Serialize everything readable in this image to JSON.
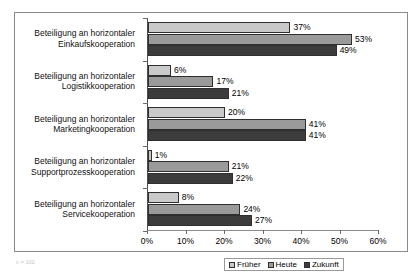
{
  "chart_data": {
    "type": "bar",
    "orientation": "horizontal",
    "title": "",
    "xlabel": "",
    "ylabel": "",
    "xlim": [
      0,
      60
    ],
    "xticks": [
      0,
      10,
      20,
      30,
      40,
      50,
      60
    ],
    "xtick_labels": [
      "0%",
      "10%",
      "20%",
      "30%",
      "40%",
      "50%",
      "60%"
    ],
    "grid": false,
    "legend_position": "bottom",
    "value_suffix": "%",
    "categories": [
      "Beteiligung an horizontaler Einkaufskooperation",
      "Beteiligung an horizontaler Logistikkooperation",
      "Beteiligung an horizontaler Marketingkooperation",
      "Beteiligung an horizontaler Supportprozesskooperation",
      "Beteiligung an horizontaler Servicekooperation"
    ],
    "category_lines": [
      [
        "Beteiligung an horizontaler",
        "Einkaufskooperation"
      ],
      [
        "Beteiligung an horizontaler",
        "Logistikkooperation"
      ],
      [
        "Beteiligung an horizontaler",
        "Marketingkooperation"
      ],
      [
        "Beteiligung an horizontaler",
        "Supportprozesskooperation"
      ],
      [
        "Beteiligung an horizontaler",
        "Servicekooperation"
      ]
    ],
    "series": [
      {
        "name": "Früher",
        "color": "#c9c9c9",
        "values": [
          37,
          6,
          20,
          1,
          8
        ]
      },
      {
        "name": "Heute",
        "color": "#9a9a9a",
        "values": [
          53,
          17,
          41,
          21,
          24
        ]
      },
      {
        "name": "Zukunft",
        "color": "#3c3c3c",
        "values": [
          49,
          21,
          41,
          22,
          27
        ]
      }
    ],
    "data_labels": [
      [
        "37%",
        "53%",
        "49%"
      ],
      [
        "6%",
        "17%",
        "21%"
      ],
      [
        "20%",
        "41%",
        "41%"
      ],
      [
        "1%",
        "21%",
        "22%"
      ],
      [
        "8%",
        "24%",
        "27%"
      ]
    ]
  },
  "legend": {
    "items": [
      {
        "label": "Früher"
      },
      {
        "label": "Heute"
      },
      {
        "label": "Zukunft"
      }
    ]
  },
  "caption": {
    "text": "n = 102"
  }
}
